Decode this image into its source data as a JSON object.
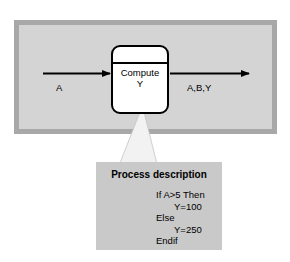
{
  "diagram": {
    "type": "context-process-diagram",
    "frame": {
      "border_color": "#a8a8a8",
      "fill_color": "#d4d4d4"
    },
    "process": {
      "label": "Compute\nY",
      "shape": "rounded-rectangle-with-header-divider",
      "fill_color": "#ffffff",
      "stroke_color": "#000000"
    },
    "flows": [
      {
        "id": "input",
        "label": "A",
        "direction": "into-process"
      },
      {
        "id": "output",
        "label": "A,B,Y",
        "direction": "out-of-process"
      }
    ],
    "description_box": {
      "title": "Process description",
      "fill_color": "#c9c9c9",
      "code_lines": [
        {
          "text": "If A>5 Then",
          "indent": false
        },
        {
          "text": "Y=100",
          "indent": true
        },
        {
          "text": "Else",
          "indent": false
        },
        {
          "text": "Y=250",
          "indent": true
        },
        {
          "text": "Endif",
          "indent": false
        }
      ]
    }
  }
}
